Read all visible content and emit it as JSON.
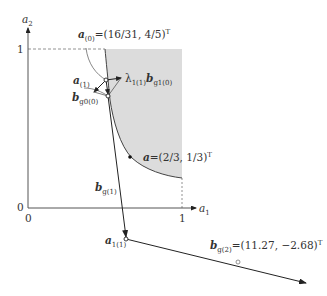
{
  "axes": {
    "x_label": "a",
    "x_label_sub": "1",
    "y_label": "a",
    "y_label_sub": "2",
    "origin_x_tick": "0",
    "origin_y_tick": "0",
    "x_tick_one": "1",
    "y_tick_one": "1"
  },
  "labels": {
    "a0": {
      "sym": "a",
      "sub": "(0)",
      "value": "=(16/31, 4/5)",
      "sup": "T"
    },
    "a1": {
      "sym": "a",
      "sub": "(1)"
    },
    "lambda": {
      "pre": "λ",
      "pre_sub": "1(1)",
      "sym": "b",
      "sub": "g1(0)"
    },
    "bg0": {
      "sym": "b",
      "sub": "g0(0)"
    },
    "a_opt": {
      "sym": "a",
      "value": "=(2/3, 1/3)",
      "sup": "T"
    },
    "bg1": {
      "sym": "b",
      "sub": "g(1)"
    },
    "a11": {
      "sym": "a",
      "sub": "1(1)"
    },
    "bg2": {
      "sym": "b",
      "sub": "g(2)",
      "value": "=(11.27, −2.68)",
      "sup": "T"
    }
  },
  "colors": {
    "feasible_region": "#dcdcdc",
    "line": "#333333",
    "axis": "#555555"
  }
}
